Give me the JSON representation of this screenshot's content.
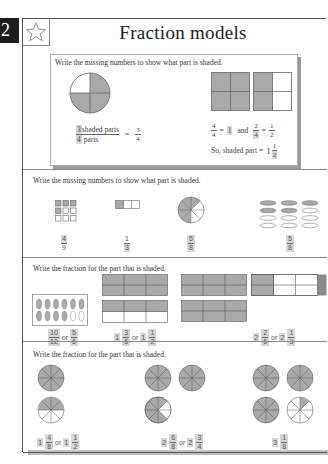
{
  "page": {
    "number": "2",
    "title": "Fraction models",
    "icon": "star-icon"
  },
  "example": {
    "instruction": "Write the missing numbers to show what part is shaded.",
    "circle": {
      "parts": 4,
      "shaded": 3
    },
    "circle_caption": {
      "numerator_answer": "3",
      "numerator_text": "shaded parts",
      "denominator_answer": "4",
      "denominator_text": "parts",
      "equals": "=",
      "result_num": "3",
      "result_den": "4"
    },
    "squares": [
      {
        "parts": 4,
        "shaded": 4
      },
      {
        "parts": 4,
        "shaded": 2
      }
    ],
    "squares_caption": {
      "line1_a_num": "4",
      "line1_a_den": "4",
      "line1_eq": "=",
      "line1_answer": "1",
      "line1_and": "and",
      "line1_b_num": "2",
      "line1_b_den_answer": "4",
      "line1_b_eq": "=",
      "line1_c_num": "1",
      "line1_c_den": "2",
      "line2_text": "So, shaded part =",
      "line2_whole": "1",
      "line2_num": "1",
      "line2_den_answer": "2"
    }
  },
  "section1": {
    "instruction": "Write the missing numbers to show what part is shaded.",
    "items": [
      {
        "model": "squares-grid",
        "total": 9,
        "shaded": 4,
        "num": "4",
        "den": "9",
        "answer_part": "num"
      },
      {
        "model": "bar",
        "total": 3,
        "shaded": 1,
        "num": "1",
        "den": "3",
        "answer_part": "den"
      },
      {
        "model": "circle",
        "total": 8,
        "shaded": 5,
        "num": "5",
        "den": "8",
        "answer_part": "both"
      },
      {
        "model": "ovals",
        "total": 12,
        "shaded": 5,
        "num": "5",
        "den": "8",
        "answer_part": "both"
      }
    ]
  },
  "section2": {
    "instruction": "Write the fraction for the part that is shaded.",
    "items": [
      {
        "model": "ovals",
        "total": 12,
        "shaded": 10,
        "answer": {
          "a_num": "10",
          "a_den": "12",
          "or": "or",
          "b_num": "5",
          "b_den": "6"
        }
      },
      {
        "model": "bars",
        "answer": {
          "a_whole": "1",
          "a_num": "3",
          "a_den": "6",
          "or": "or",
          "b_whole": "1",
          "b_num": "1",
          "b_den": "2"
        }
      },
      {
        "model": "bars",
        "answer": {
          "a_whole": "2",
          "a_num": "2",
          "a_den": "6",
          "or": "or",
          "b_whole": "2",
          "b_num": "1",
          "b_den": "3"
        }
      }
    ]
  },
  "section3": {
    "instruction": "Write the fraction for the part that is shaded.",
    "items": [
      {
        "answer": {
          "a_whole": "1",
          "a_num": "4",
          "a_den": "8",
          "or": "or",
          "b_whole": "1",
          "b_num": "1",
          "b_den": "2"
        }
      },
      {
        "answer": {
          "a_whole": "2",
          "a_num": "6",
          "a_den": "8",
          "or": "or",
          "b_whole": "2",
          "b_num": "3",
          "b_den": "4"
        }
      },
      {
        "answer": {
          "a_whole": "3",
          "a_num": "1",
          "a_den": "8"
        }
      }
    ]
  },
  "colors": {
    "shade": "#a9a9a9",
    "line": "#555555",
    "answer_highlight": "#d6d6d6",
    "page_tab": "#1e1e1e"
  }
}
